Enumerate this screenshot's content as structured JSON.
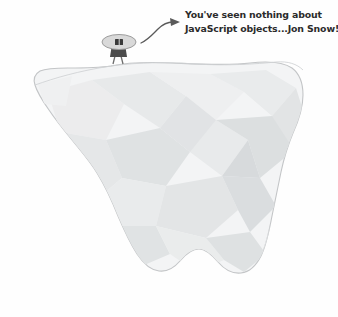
{
  "illustration": {
    "title": "iceberg-with-figure-illustration",
    "background_color": "#fefefe",
    "caption": {
      "line1": "You've seen nothing about",
      "line2": "JavaScript objects...Jon Snow!",
      "text_color": "#2b2b2b"
    },
    "annotation": {
      "arrow_name": "curved-pointer-arrow",
      "arrow_color": "#5a5a5a"
    },
    "character": {
      "name": "cloaked-figure",
      "hat_label": "wide-oval-hood",
      "hat_color": "#d8d8d8",
      "hat_outline_color": "#9a9a9a",
      "face_color": "#3a3a3a",
      "body_color": "#4a4a4a",
      "leg_color": "#6a6a6a"
    },
    "iceberg": {
      "name": "iceberg-body",
      "outline_color": "#c2c4c6",
      "fill_color": "#f2f3f4",
      "facet_colors": [
        "#eceded",
        "#e4e6e7",
        "#dddfe0",
        "#e9eaeb",
        "#d9dcdd",
        "#f0f1f1"
      ]
    }
  }
}
